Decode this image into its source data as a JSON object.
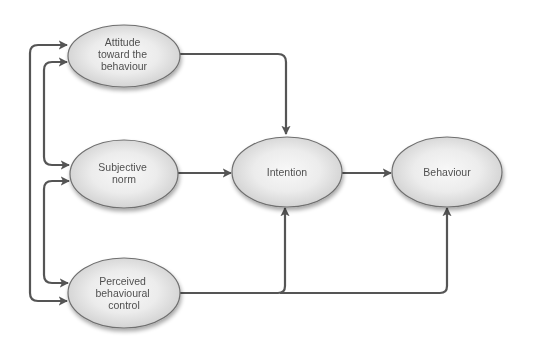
{
  "colors": {
    "background": "#ffffff",
    "edge": "#555555",
    "node_border": "#6f6f6f",
    "node_fill_center": "#f7f7f7",
    "node_fill_edge": "#d2d2d2",
    "text": "#505050"
  },
  "nodes": {
    "attitude": {
      "lines": [
        "Attitude",
        "toward the",
        "behaviour"
      ]
    },
    "subjective_norm": {
      "lines": [
        "Subjective",
        "norm"
      ]
    },
    "perceived_control": {
      "lines": [
        "Perceived",
        "behavioural",
        "control"
      ]
    },
    "intention": {
      "lines": [
        "Intention"
      ]
    },
    "behaviour": {
      "lines": [
        "Behaviour"
      ]
    }
  },
  "edges": [
    {
      "from": "attitude",
      "to": "intention",
      "type": "directed"
    },
    {
      "from": "subjective_norm",
      "to": "intention",
      "type": "directed"
    },
    {
      "from": "perceived_control",
      "to": "intention",
      "type": "directed"
    },
    {
      "from": "perceived_control",
      "to": "behaviour",
      "type": "directed"
    },
    {
      "from": "intention",
      "to": "behaviour",
      "type": "directed"
    },
    {
      "from": "attitude",
      "to": "subjective_norm",
      "type": "bidirectional"
    },
    {
      "from": "subjective_norm",
      "to": "perceived_control",
      "type": "bidirectional"
    },
    {
      "from": "attitude",
      "to": "perceived_control",
      "type": "bidirectional"
    }
  ]
}
